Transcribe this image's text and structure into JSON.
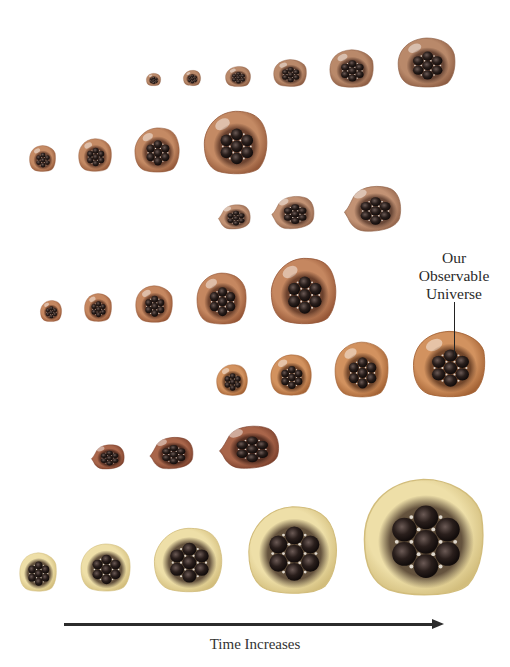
{
  "diagram": {
    "callout": {
      "lines": [
        "Our",
        "Observable",
        "Universe"
      ],
      "center_x": 454,
      "top_y": 249,
      "pointer": {
        "x": 454,
        "y1": 302,
        "y2": 356
      }
    },
    "axis": {
      "label": "Time Increases",
      "direction": "left-to-right"
    },
    "colors": {
      "row1": {
        "outer": "#b9896a",
        "edge": "#8d5d43",
        "core": "#5a3a2c"
      },
      "row2": {
        "outer": "#c48a64",
        "edge": "#94593a",
        "core": "#5e3828"
      },
      "row3": {
        "outer": "#c29274",
        "edge": "#91634a",
        "core": "#5b3c2e"
      },
      "row4": {
        "outer": "#c58760",
        "edge": "#955636",
        "core": "#5c3524"
      },
      "row5": {
        "outer": "#d2925f",
        "edge": "#a36234",
        "core": "#623a22"
      },
      "row6": {
        "outer": "#a8654a",
        "edge": "#7a3f2b",
        "core": "#4a271c"
      },
      "row7": {
        "outer": "#eedfa8",
        "edge": "#d2bd7c",
        "core": "#4c3a2b"
      }
    },
    "rows": [
      {
        "id": "row1",
        "bubbles": [
          {
            "x": 146,
            "y": 73,
            "w": 15,
            "h": 13,
            "tail": false
          },
          {
            "x": 183,
            "y": 70,
            "w": 18,
            "h": 16,
            "tail": false
          },
          {
            "x": 225,
            "y": 66,
            "w": 26,
            "h": 21,
            "tail": false
          },
          {
            "x": 273,
            "y": 59,
            "w": 34,
            "h": 28,
            "tail": false
          },
          {
            "x": 329,
            "y": 49,
            "w": 45,
            "h": 39,
            "tail": false
          },
          {
            "x": 397,
            "y": 37,
            "w": 59,
            "h": 51,
            "tail": false
          }
        ]
      },
      {
        "id": "row2",
        "bubbles": [
          {
            "x": 29,
            "y": 145,
            "w": 27,
            "h": 27,
            "tail": false
          },
          {
            "x": 78,
            "y": 138,
            "w": 34,
            "h": 34,
            "tail": false
          },
          {
            "x": 134,
            "y": 127,
            "w": 46,
            "h": 46,
            "tail": false
          },
          {
            "x": 203,
            "y": 110,
            "w": 65,
            "h": 65,
            "tail": false
          }
        ]
      },
      {
        "id": "row3",
        "bubbles": [
          {
            "x": 217,
            "y": 203,
            "w": 34,
            "h": 27,
            "tail": true
          },
          {
            "x": 270,
            "y": 194,
            "w": 45,
            "h": 36,
            "tail": true
          },
          {
            "x": 342,
            "y": 183,
            "w": 60,
            "h": 50,
            "tail": true
          }
        ]
      },
      {
        "id": "row4",
        "bubbles": [
          {
            "x": 40,
            "y": 300,
            "w": 22,
            "h": 22,
            "tail": false
          },
          {
            "x": 84,
            "y": 293,
            "w": 28,
            "h": 29,
            "tail": false
          },
          {
            "x": 135,
            "y": 285,
            "w": 38,
            "h": 38,
            "tail": false
          },
          {
            "x": 196,
            "y": 272,
            "w": 51,
            "h": 53,
            "tail": false
          },
          {
            "x": 270,
            "y": 257,
            "w": 67,
            "h": 68,
            "tail": false
          }
        ]
      },
      {
        "id": "row5",
        "bubbles": [
          {
            "x": 216,
            "y": 364,
            "w": 32,
            "h": 32,
            "tail": false
          },
          {
            "x": 270,
            "y": 354,
            "w": 42,
            "h": 42,
            "tail": false
          },
          {
            "x": 334,
            "y": 341,
            "w": 55,
            "h": 57,
            "tail": false
          },
          {
            "x": 412,
            "y": 330,
            "w": 74,
            "h": 68,
            "tail": false,
            "observable": true
          }
        ]
      },
      {
        "id": "row6",
        "bubbles": [
          {
            "x": 90,
            "y": 443,
            "w": 35,
            "h": 27,
            "tail": true
          },
          {
            "x": 148,
            "y": 435,
            "w": 46,
            "h": 35,
            "tail": true
          },
          {
            "x": 217,
            "y": 423,
            "w": 63,
            "h": 47,
            "tail": true
          }
        ]
      },
      {
        "id": "row7",
        "bubbles": [
          {
            "x": 19,
            "y": 552,
            "w": 38,
            "h": 40,
            "tail": false
          },
          {
            "x": 80,
            "y": 543,
            "w": 51,
            "h": 49,
            "tail": false
          },
          {
            "x": 153,
            "y": 527,
            "w": 70,
            "h": 66,
            "tail": false
          },
          {
            "x": 247,
            "y": 505,
            "w": 91,
            "h": 90,
            "tail": false
          },
          {
            "x": 362,
            "y": 477,
            "w": 123,
            "h": 120,
            "tail": false
          }
        ]
      }
    ]
  }
}
